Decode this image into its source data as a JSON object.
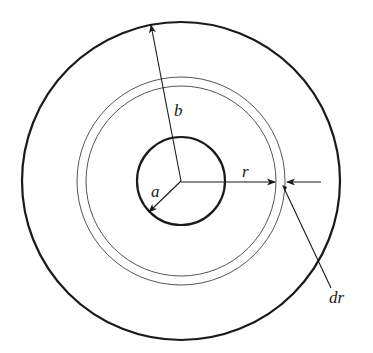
{
  "diagram": {
    "center": [
      181,
      181
    ],
    "colors": {
      "stroke": "#1a1a1a",
      "thin_stroke": "#555555",
      "background": "#ffffff"
    },
    "circles": {
      "outer": {
        "r": 159,
        "stroke_width": 2.2
      },
      "shell_inner": {
        "r": 95,
        "stroke_width": 1
      },
      "shell_outer": {
        "r": 104,
        "stroke_width": 1
      },
      "inner": {
        "r": 44,
        "stroke_width": 2.2
      }
    },
    "labels": {
      "b": "b",
      "a": "a",
      "r": "r",
      "dr": "dr"
    }
  }
}
